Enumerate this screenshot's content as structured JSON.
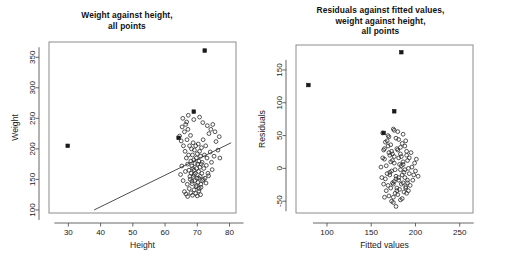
{
  "figure": {
    "background": "#ffffff",
    "panel_count": 2
  },
  "chart_data": [
    {
      "type": "scatter",
      "panel": "left",
      "title": "Weight against height,\nall points",
      "xlabel": "Height",
      "ylabel": "Weight",
      "xlim": [
        24,
        82
      ],
      "ylim": [
        95,
        375
      ],
      "xticks": [
        30,
        40,
        50,
        60,
        70,
        80
      ],
      "yticks": [
        100,
        150,
        200,
        250,
        300,
        350
      ],
      "grid": false,
      "legend": "none",
      "box": true,
      "regression_line": {
        "x": [
          38.0,
          80.5
        ],
        "y": [
          100.0,
          210.0
        ],
        "color": "#3a3a3a"
      },
      "series": [
        {
          "name": "observations",
          "marker": "open-circle",
          "color": "#2b2b2b",
          "points": [
            [
              64.5,
              221
            ],
            [
              65.0,
              213
            ],
            [
              65.3,
              236
            ],
            [
              65.7,
              205
            ],
            [
              66.0,
              228
            ],
            [
              66.2,
              196
            ],
            [
              66.4,
              240
            ],
            [
              66.6,
              185
            ],
            [
              66.8,
              215
            ],
            [
              67.0,
              175
            ],
            [
              67.1,
              232
            ],
            [
              67.3,
              190
            ],
            [
              67.4,
              165
            ],
            [
              67.6,
              205
            ],
            [
              67.8,
              150
            ],
            [
              67.9,
              222
            ],
            [
              68.0,
              180
            ],
            [
              68.1,
              160
            ],
            [
              68.2,
              200
            ],
            [
              68.3,
              172
            ],
            [
              68.4,
              143
            ],
            [
              68.5,
              190
            ],
            [
              68.6,
              168
            ],
            [
              68.7,
              210
            ],
            [
              68.8,
              155
            ],
            [
              68.9,
              182
            ],
            [
              69.0,
              165
            ],
            [
              69.1,
              198
            ],
            [
              69.2,
              148
            ],
            [
              69.3,
              176
            ],
            [
              69.4,
              160
            ],
            [
              69.5,
              205
            ],
            [
              69.6,
              138
            ],
            [
              69.7,
              185
            ],
            [
              69.8,
              168
            ],
            [
              69.9,
              152
            ],
            [
              70.0,
              192
            ],
            [
              70.1,
              175
            ],
            [
              70.2,
              145
            ],
            [
              70.3,
              208
            ],
            [
              70.4,
              163
            ],
            [
              70.5,
              180
            ],
            [
              70.6,
              135
            ],
            [
              70.7,
              196
            ],
            [
              70.8,
              170
            ],
            [
              70.9,
              155
            ],
            [
              71.0,
              188
            ],
            [
              71.1,
              142
            ],
            [
              71.2,
              175
            ],
            [
              71.3,
              202
            ],
            [
              71.4,
              160
            ],
            [
              71.5,
              178
            ],
            [
              71.6,
              148
            ],
            [
              71.8,
              215
            ],
            [
              72.0,
              168
            ],
            [
              72.2,
              190
            ],
            [
              72.4,
              152
            ],
            [
              72.6,
              205
            ],
            [
              72.8,
              173
            ],
            [
              73.0,
              185
            ],
            [
              73.3,
              160
            ],
            [
              73.6,
              225
            ],
            [
              74.0,
              195
            ],
            [
              74.4,
              178
            ],
            [
              74.8,
              240
            ],
            [
              75.2,
              188
            ],
            [
              75.8,
              212
            ],
            [
              76.4,
              198
            ],
            [
              77.0,
              185
            ],
            [
              66.0,
              130
            ],
            [
              66.5,
              126
            ],
            [
              67.0,
              122
            ],
            [
              67.5,
              135
            ],
            [
              68.0,
              128
            ],
            [
              68.5,
              124
            ],
            [
              69.0,
              133
            ],
            [
              69.5,
              127
            ],
            [
              70.0,
              123
            ],
            [
              70.5,
              131
            ],
            [
              71.0,
              125
            ],
            [
              64.8,
              158
            ],
            [
              65.2,
              172
            ],
            [
              65.6,
              148
            ],
            [
              66.3,
              163
            ],
            [
              66.9,
              142
            ],
            [
              67.7,
              155
            ],
            [
              68.35,
              147
            ],
            [
              69.05,
              158
            ],
            [
              69.75,
              140
            ],
            [
              70.45,
              152
            ],
            [
              71.15,
              137
            ],
            [
              71.9,
              150
            ],
            [
              72.7,
              144
            ],
            [
              73.5,
              156
            ],
            [
              74.6,
              166
            ],
            [
              65.5,
              250
            ],
            [
              66.7,
              244
            ],
            [
              67.2,
              255
            ],
            [
              68.9,
              248
            ],
            [
              70.7,
              252
            ],
            [
              71.7,
              243
            ],
            [
              73.1,
              238
            ],
            [
              74.2,
              232
            ],
            [
              75.5,
              228
            ],
            [
              76.8,
              220
            ]
          ]
        },
        {
          "name": "flagged-outliers",
          "marker": "filled-square",
          "color": "#1a1a1a",
          "points": [
            [
              29.8,
              205
            ],
            [
              64.2,
              218
            ],
            [
              68.9,
              261
            ],
            [
              72.3,
              361
            ]
          ]
        }
      ]
    },
    {
      "type": "scatter",
      "panel": "right",
      "title": "Residuals against fitted values,\nweight against height,\nall points",
      "xlabel": "Fitted values",
      "ylabel": "Residuals",
      "xlim": [
        65,
        265
      ],
      "ylim": [
        -68,
        188
      ],
      "xticks": [
        100,
        150,
        200,
        250
      ],
      "yticks": [
        -50,
        0,
        50,
        100,
        150
      ],
      "grid": false,
      "legend": "none",
      "box": true,
      "series": [
        {
          "name": "residuals",
          "marker": "open-circle",
          "color": "#2b2b2b",
          "points": [
            [
              163,
              54
            ],
            [
              170,
              48
            ],
            [
              176,
              58
            ],
            [
              181,
              44
            ],
            [
              186,
              52
            ],
            [
              166,
              40
            ],
            [
              172,
              36
            ],
            [
              178,
              46
            ],
            [
              183,
              32
            ],
            [
              189,
              42
            ],
            [
              164,
              28
            ],
            [
              169,
              34
            ],
            [
              174,
              22
            ],
            [
              179,
              30
            ],
            [
              184,
              18
            ],
            [
              190,
              26
            ],
            [
              195,
              24
            ],
            [
              165,
              14
            ],
            [
              171,
              20
            ],
            [
              176,
              8
            ],
            [
              181,
              16
            ],
            [
              186,
              6
            ],
            [
              191,
              12
            ],
            [
              196,
              2
            ],
            [
              167,
              4
            ],
            [
              172,
              10
            ],
            [
              177,
              -2
            ],
            [
              182,
              6
            ],
            [
              187,
              -6
            ],
            [
              192,
              0
            ],
            [
              168,
              -8
            ],
            [
              173,
              -4
            ],
            [
              178,
              -12
            ],
            [
              183,
              -2
            ],
            [
              188,
              -14
            ],
            [
              193,
              -8
            ],
            [
              198,
              -10
            ],
            [
              166,
              -16
            ],
            [
              171,
              -10
            ],
            [
              176,
              -20
            ],
            [
              181,
              -14
            ],
            [
              186,
              -22
            ],
            [
              191,
              -18
            ],
            [
              169,
              -26
            ],
            [
              174,
              -22
            ],
            [
              179,
              -30
            ],
            [
              184,
              -24
            ],
            [
              189,
              -28
            ],
            [
              194,
              -26
            ],
            [
              167,
              -34
            ],
            [
              172,
              -30
            ],
            [
              177,
              -38
            ],
            [
              182,
              -32
            ],
            [
              187,
              -36
            ],
            [
              192,
              -34
            ],
            [
              170,
              -42
            ],
            [
              175,
              -44
            ],
            [
              180,
              -40
            ],
            [
              185,
              -46
            ],
            [
              175,
              -52
            ],
            [
              178,
              -58
            ],
            [
              173,
              -50
            ],
            [
              183,
              -48
            ],
            [
              165,
              -44
            ],
            [
              190,
              -38
            ],
            [
              161,
              2
            ],
            [
              162,
              -14
            ],
            [
              163,
              16
            ],
            [
              164,
              -24
            ],
            [
              165,
              30
            ],
            [
              197,
              -18
            ],
            [
              199,
              8
            ],
            [
              200,
              -4
            ],
            [
              201,
              14
            ],
            [
              203,
              -12
            ],
            [
              175,
              60
            ],
            [
              180,
              56
            ],
            [
              185,
              38
            ],
            [
              169,
              50
            ],
            [
              188,
              34
            ],
            [
              171,
              -6
            ],
            [
              176,
              18
            ],
            [
              181,
              -18
            ],
            [
              186,
              10
            ],
            [
              191,
              -22
            ],
            [
              173,
              26
            ],
            [
              178,
              -16
            ],
            [
              183,
              22
            ],
            [
              188,
              -2
            ],
            [
              193,
              16
            ],
            [
              168,
              42
            ],
            [
              174,
              12
            ],
            [
              179,
              -34
            ],
            [
              184,
              4
            ],
            [
              189,
              -30
            ],
            [
              170,
              24
            ],
            [
              175,
              -24
            ],
            [
              180,
              28
            ],
            [
              185,
              -10
            ],
            [
              190,
              20
            ]
          ]
        },
        {
          "name": "flagged-outliers",
          "marker": "filled-square",
          "color": "#1a1a1a",
          "points": [
            [
              79,
              127
            ],
            [
              164,
              54
            ],
            [
              176,
              87
            ],
            [
              184,
              177
            ]
          ]
        }
      ]
    }
  ]
}
